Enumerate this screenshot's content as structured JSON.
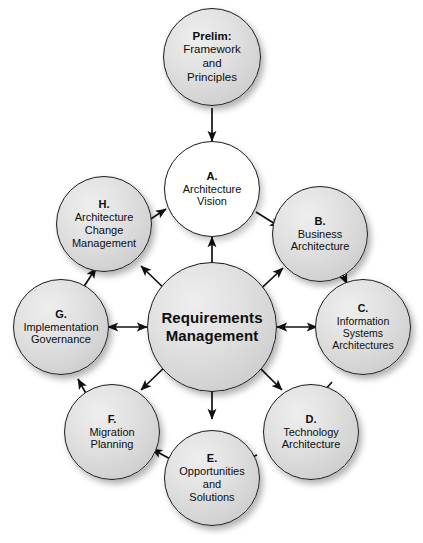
{
  "diagram": {
    "colors": {
      "node_fill": "#d9d9d9",
      "node_fill_highlight": "#eeeeee",
      "node_stroke": "#1a1a1a",
      "vision_fill": "#ffffff",
      "text": "#0d0d0d",
      "background": "#ffffff"
    },
    "center": {
      "id": "requirements-management",
      "lines": [
        "Requirements",
        "Management"
      ],
      "fill": "shaded"
    },
    "preliminary": {
      "id": "prelim",
      "letter": "Prelim:",
      "lines": [
        "Framework",
        "and",
        "Principles"
      ],
      "fill": "shaded"
    },
    "phases": [
      {
        "id": "a",
        "letter": "A.",
        "lines": [
          "Architecture",
          "Vision"
        ],
        "fill": "plain"
      },
      {
        "id": "b",
        "letter": "B.",
        "lines": [
          "Business",
          "Architecture"
        ],
        "fill": "shaded"
      },
      {
        "id": "c",
        "letter": "C.",
        "lines": [
          "Information",
          "Systems",
          "Architectures"
        ],
        "fill": "shaded"
      },
      {
        "id": "d",
        "letter": "D.",
        "lines": [
          "Technology",
          "Architecture"
        ],
        "fill": "shaded"
      },
      {
        "id": "e",
        "letter": "E.",
        "lines": [
          "Opportunities",
          "and",
          "Solutions"
        ],
        "fill": "shaded"
      },
      {
        "id": "f",
        "letter": "F.",
        "lines": [
          "Migration",
          "Planning"
        ],
        "fill": "shaded"
      },
      {
        "id": "g",
        "letter": "G.",
        "lines": [
          "Implementation",
          "Governance"
        ],
        "fill": "shaded"
      },
      {
        "id": "h",
        "letter": "H.",
        "lines": [
          "Architecture",
          "Change",
          "Management"
        ],
        "fill": "shaded"
      }
    ],
    "connections": {
      "cycle_direction": "clockwise",
      "ring_arrows": "single-headed",
      "spoke_arrows": "double-headed",
      "entry_arrow": "prelim-to-a"
    }
  }
}
